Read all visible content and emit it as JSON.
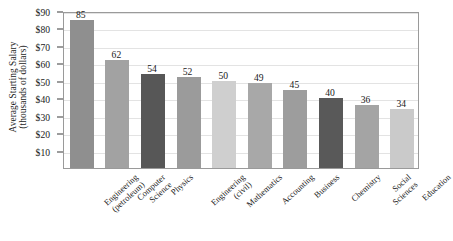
{
  "chart_data": {
    "type": "bar",
    "title": "",
    "xlabel": "",
    "ylabel": "Average Starting Salary (thousands of dollars)",
    "ylabel_lines": [
      "Average Starting Salary",
      "(thousands of dollars)"
    ],
    "ylim": [
      0,
      90
    ],
    "grid": true,
    "legend": "none",
    "ytick_values": [
      90,
      80,
      70,
      60,
      50,
      40,
      30,
      20,
      10
    ],
    "ytick_labels": [
      "$90",
      "$80",
      "$70",
      "$60",
      "$50",
      "$40",
      "$30",
      "$20",
      "$10"
    ],
    "categories": [
      "Engineering (petroleum)",
      "Computer Science",
      "Physics",
      "Engineering (civil)",
      "Mathematics",
      "Accounting",
      "Business",
      "Chemistry",
      "Social Sciences",
      "Education"
    ],
    "category_lines": [
      [
        "Engineering",
        "(petroleum)"
      ],
      [
        "Computer",
        "Science"
      ],
      [
        "Physics"
      ],
      [
        "Engineering",
        "(civil)"
      ],
      [
        "Mathematics"
      ],
      [
        "Accounting"
      ],
      [
        "Business"
      ],
      [
        "Chemistry"
      ],
      [
        "Social",
        "Sciences"
      ],
      [
        "Education"
      ]
    ],
    "values": [
      85,
      62,
      54,
      52,
      50,
      49,
      45,
      40,
      36,
      34
    ],
    "value_labels": [
      "85",
      "62",
      "54",
      "52",
      "50",
      "49",
      "45",
      "40",
      "36",
      "34"
    ],
    "bar_colors": [
      "#8f8f8f",
      "#a2a2a2",
      "#575757",
      "#9b9b9b",
      "#cfcfcf",
      "#a8a8a8",
      "#9d9d9d",
      "#595959",
      "#a4a4a4",
      "#cacaca"
    ],
    "colors": {
      "background": "#ffffff",
      "axis": "#9a9a9a",
      "gridline": "#e3e3e3",
      "text": "#1a1a1a"
    }
  }
}
